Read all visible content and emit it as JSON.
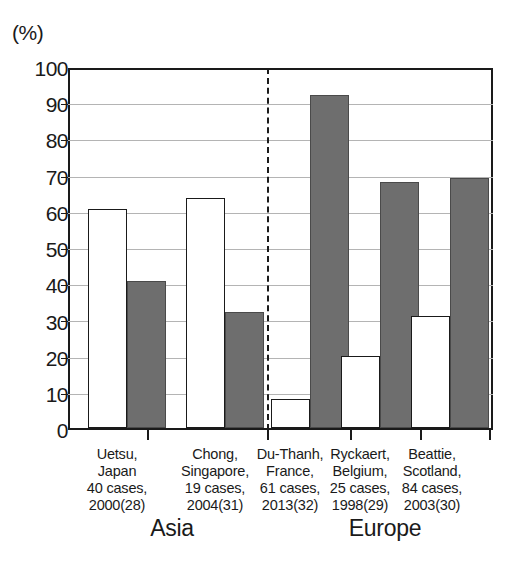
{
  "chart_data": {
    "type": "bar",
    "title": "",
    "xlabel": "",
    "ylabel": "(%)",
    "ylim": [
      0,
      100
    ],
    "ytick_step": 10,
    "grid": true,
    "legend_position": "none",
    "categories": [
      "Uetsu, Japan 40 cases, 2000(28)",
      "Chong, Singapore, 19 cases, 2004(31)",
      "Du-Thanh, France, 61 cases, 2013(32)",
      "Ryckaert, Belgium, 25 cases, 1998(29)",
      "Beattie, Scotland, 84 cases, 2003(30)"
    ],
    "series": [
      {
        "name": "open-bar",
        "fill": "white",
        "values": [
          60.5,
          63.5,
          8,
          20,
          31
        ]
      },
      {
        "name": "filled-bar",
        "fill": "gray",
        "values": [
          40.5,
          32,
          92,
          68,
          69
        ]
      }
    ],
    "ytick_labels": [
      "100",
      "90",
      "80",
      "70",
      "60",
      "50",
      "40",
      "30",
      "20",
      "10",
      "0"
    ],
    "regions": [
      {
        "label": "Asia",
        "categories": [
          0,
          1
        ]
      },
      {
        "label": "Europe",
        "categories": [
          2,
          3,
          4
        ]
      }
    ],
    "colors": {
      "filled_bar": "#6e6e6e",
      "open_bar": "#ffffff",
      "axis": "#1a1a1a",
      "gridline": "#b4b4b4",
      "background": "#ffffff"
    }
  },
  "axis": {
    "unit_label": "(%)"
  },
  "groups": [
    {
      "name": "Uetsu",
      "lines": [
        "Uetsu,",
        "Japan",
        "40 cases,",
        "2000(28)"
      ]
    },
    {
      "name": "Chong",
      "lines": [
        "Chong,",
        "Singapore,",
        "19 cases,",
        "2004(31)"
      ]
    },
    {
      "name": "Du-Thanh",
      "lines": [
        "Du-Thanh,",
        "France,",
        "61 cases,",
        "2013(32)"
      ]
    },
    {
      "name": "Ryckaert",
      "lines": [
        "Ryckaert,",
        "Belgium,",
        "25 cases,",
        "1998(29)"
      ]
    },
    {
      "name": "Beattie",
      "lines": [
        "Beattie,",
        "Scotland,",
        "84 cases,",
        "2003(30)"
      ]
    }
  ],
  "regions": {
    "asia": "Asia",
    "europe": "Europe"
  }
}
